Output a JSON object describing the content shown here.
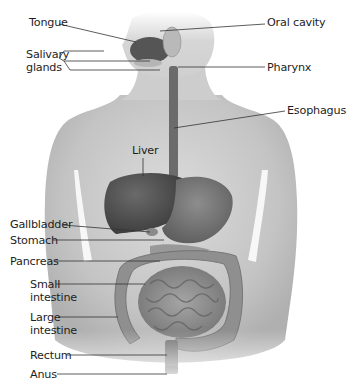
{
  "diagram": {
    "style": "grayscale anatomical illustration",
    "colors": {
      "background": "#ffffff",
      "label_text": "#1e1e1e",
      "leader_line": "#333333",
      "skin_light": "#d8d8d8",
      "skin_dark": "#a9a9a9",
      "organ_dark": "#4a4a4a",
      "organ_mid": "#7a7a7a"
    },
    "labels": {
      "tongue": "Tongue",
      "salivary_glands": "Salivary\nglands",
      "oral_cavity": "Oral cavity",
      "pharynx": "Pharynx",
      "esophagus": "Esophagus",
      "liver": "Liver",
      "gallbladder": "Gallbladder",
      "stomach": "Stomach",
      "pancreas": "Pancreas",
      "small_intestine": "Small\nintestine",
      "large_intestine": "Large\nintestine",
      "rectum": "Rectum",
      "anus": "Anus"
    }
  }
}
